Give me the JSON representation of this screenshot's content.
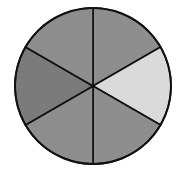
{
  "diagram": {
    "type": "fraction-circle",
    "sectors_total": 6,
    "center": [
      93,
      86
    ],
    "radius": 78,
    "stroke_color": "#111111",
    "sectors": [
      {
        "label": "top-right",
        "start_deg": -90,
        "end_deg": -30,
        "color": "#8e8e8e",
        "shaded": false
      },
      {
        "label": "right",
        "start_deg": -30,
        "end_deg": 30,
        "color": "#dadada",
        "shaded": true
      },
      {
        "label": "bottom-right",
        "start_deg": 30,
        "end_deg": 90,
        "color": "#8e8e8e",
        "shaded": false
      },
      {
        "label": "bottom-left",
        "start_deg": 90,
        "end_deg": 150,
        "color": "#8e8e8e",
        "shaded": false
      },
      {
        "label": "left",
        "start_deg": 150,
        "end_deg": 210,
        "color": "#7b7b7b",
        "shaded": false
      },
      {
        "label": "top-left",
        "start_deg": 210,
        "end_deg": 270,
        "color": "#8e8e8e",
        "shaded": false
      }
    ]
  }
}
